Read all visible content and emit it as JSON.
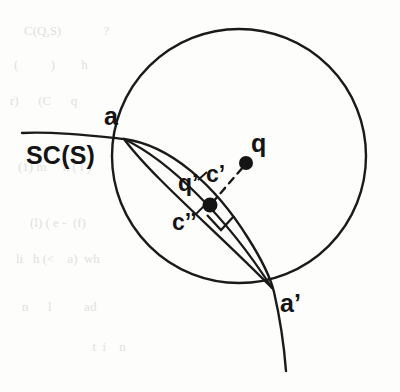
{
  "figure": {
    "kind": "geometry-diagram",
    "caption_labels": {
      "curve_label": "SC(S)",
      "point_a": "a",
      "point_a_prime": "a’",
      "point_q": "q",
      "point_q_prime": "q’",
      "arc_c_prime": "c’",
      "arc_c_double_prime": "c’’"
    },
    "colors": {
      "stroke": "#1a1a1a",
      "background": "#fdfdfc",
      "label": "#141414",
      "ghost": "#e2e1dd"
    },
    "geometry": {
      "circle": {
        "cx": 239,
        "cy": 156,
        "r": 127
      },
      "point_a": {
        "x": 124,
        "y": 139
      },
      "point_a_prime": {
        "x": 272,
        "y": 288
      },
      "point_q": {
        "x": 246,
        "y": 163
      },
      "point_q_prime": {
        "x": 210,
        "y": 205
      },
      "dot_radius": 7
    },
    "ghost_rows": [
      "C(Q,S)             ?",
      "(          )        h",
      "r)      (C      q   ",
      "(1) m     n ( l )   ",
      "(l) ( e -  (f)      ",
      "li   h (<    a)  wh ",
      "n      l          ad",
      "          t  i    n "
    ]
  }
}
